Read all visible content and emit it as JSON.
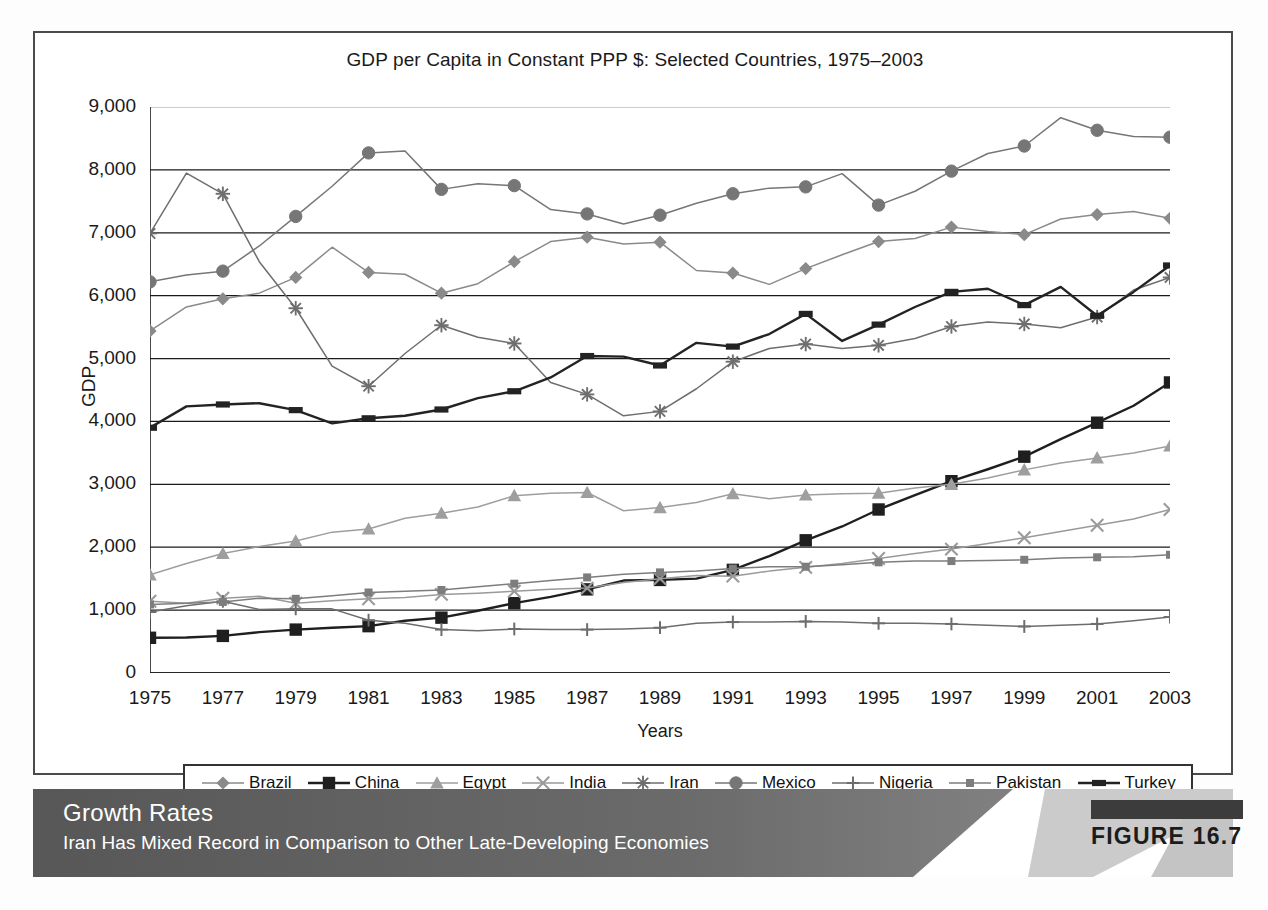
{
  "figure": {
    "badge_label": "FIGURE 16.7",
    "banner_title": "Growth Rates",
    "banner_subtitle": "Iran Has Mixed Record in Comparison to Other Late-Developing Economies"
  },
  "chart_data": {
    "type": "line",
    "title": "GDP per Capita in Constant PPP $: Selected Countries, 1975–2003",
    "xlabel": "Years",
    "ylabel": "GDP",
    "grid": true,
    "legend_position": "bottom",
    "ylim": [
      0,
      9000
    ],
    "ytick_labels": [
      "0",
      "1,000",
      "2,000",
      "3,000",
      "4,000",
      "5,000",
      "6,000",
      "7,000",
      "8,000",
      "9,000"
    ],
    "ytick_values": [
      0,
      1000,
      2000,
      3000,
      4000,
      5000,
      6000,
      7000,
      8000,
      9000
    ],
    "xlim": [
      1975,
      2003
    ],
    "xtick_labels": [
      "1975",
      "1977",
      "1979",
      "1981",
      "1983",
      "1985",
      "1987",
      "1989",
      "1991",
      "1993",
      "1995",
      "1997",
      "1999",
      "2001",
      "2003"
    ],
    "xtick_values": [
      1975,
      1977,
      1979,
      1981,
      1983,
      1985,
      1987,
      1989,
      1991,
      1993,
      1995,
      1997,
      1999,
      2001,
      2003
    ],
    "x": [
      1975,
      1976,
      1977,
      1978,
      1979,
      1980,
      1981,
      1982,
      1983,
      1984,
      1985,
      1986,
      1987,
      1988,
      1989,
      1990,
      1991,
      1992,
      1993,
      1994,
      1995,
      1996,
      1997,
      1998,
      1999,
      2000,
      2001,
      2002,
      2003
    ],
    "series": [
      {
        "name": "Brazil",
        "marker": "diamond",
        "color": "#8a8a8a",
        "values": [
          5440,
          5820,
          5950,
          6040,
          6290,
          6770,
          6370,
          6340,
          6040,
          6190,
          6540,
          6860,
          6930,
          6820,
          6850,
          6400,
          6360,
          6180,
          6430,
          6650,
          6860,
          6910,
          7090,
          7020,
          6970,
          7220,
          7290,
          7340,
          7230
        ]
      },
      {
        "name": "China",
        "marker": "square-bold",
        "color": "#1f1f1f",
        "values": [
          560,
          565,
          590,
          650,
          690,
          720,
          745,
          830,
          880,
          990,
          1110,
          1210,
          1330,
          1470,
          1480,
          1500,
          1640,
          1860,
          2110,
          2330,
          2600,
          2830,
          3050,
          3240,
          3440,
          3720,
          3980,
          4250,
          4620
        ]
      },
      {
        "name": "Egypt",
        "marker": "triangle",
        "color": "#9e9e9e",
        "values": [
          1560,
          1740,
          1900,
          2010,
          2100,
          2240,
          2290,
          2460,
          2540,
          2640,
          2820,
          2860,
          2870,
          2580,
          2630,
          2710,
          2850,
          2770,
          2830,
          2850,
          2860,
          2940,
          3000,
          3100,
          3230,
          3340,
          3420,
          3500,
          3610
        ]
      },
      {
        "name": "India",
        "marker": "x",
        "color": "#9a9a9a",
        "values": [
          1140,
          1110,
          1190,
          1220,
          1110,
          1150,
          1180,
          1200,
          1250,
          1270,
          1300,
          1330,
          1350,
          1440,
          1500,
          1550,
          1540,
          1620,
          1680,
          1740,
          1820,
          1900,
          1970,
          2060,
          2150,
          2250,
          2350,
          2450,
          2600
        ]
      },
      {
        "name": "Iran",
        "marker": "asterisk",
        "color": "#6e6e6e",
        "values": [
          6990,
          7950,
          7620,
          6540,
          5800,
          4880,
          4560,
          5080,
          5530,
          5340,
          5240,
          4620,
          4430,
          4090,
          4160,
          4520,
          4950,
          5160,
          5230,
          5160,
          5210,
          5320,
          5510,
          5580,
          5550,
          5490,
          5660,
          6090,
          6290
        ]
      },
      {
        "name": "Mexico",
        "marker": "circle",
        "color": "#767676",
        "values": [
          6220,
          6330,
          6390,
          6790,
          7260,
          7740,
          8270,
          8300,
          7690,
          7780,
          7750,
          7370,
          7300,
          7140,
          7280,
          7470,
          7620,
          7710,
          7730,
          7940,
          7440,
          7660,
          7980,
          8260,
          8380,
          8830,
          8630,
          8530,
          8520
        ]
      },
      {
        "name": "Nigeria",
        "marker": "plus",
        "color": "#6d6d6d",
        "values": [
          970,
          1070,
          1140,
          1010,
          1020,
          1020,
          840,
          790,
          690,
          670,
          700,
          690,
          690,
          700,
          720,
          790,
          810,
          810,
          820,
          810,
          790,
          790,
          780,
          760,
          740,
          760,
          780,
          830,
          890
        ]
      },
      {
        "name": "Pakistan",
        "marker": "square-small",
        "color": "#7d7d7d",
        "values": [
          1090,
          1110,
          1130,
          1190,
          1180,
          1230,
          1280,
          1300,
          1320,
          1370,
          1420,
          1470,
          1520,
          1570,
          1600,
          1620,
          1660,
          1690,
          1690,
          1720,
          1760,
          1780,
          1780,
          1790,
          1800,
          1830,
          1840,
          1850,
          1880
        ]
      },
      {
        "name": "Turkey",
        "marker": "rect-bold",
        "color": "#232323",
        "values": [
          3900,
          4240,
          4270,
          4290,
          4180,
          3970,
          4050,
          4090,
          4190,
          4370,
          4480,
          4700,
          5040,
          5030,
          4890,
          5250,
          5190,
          5390,
          5710,
          5280,
          5540,
          5820,
          6060,
          6110,
          5850,
          6140,
          5680,
          6060,
          6480
        ]
      }
    ]
  }
}
